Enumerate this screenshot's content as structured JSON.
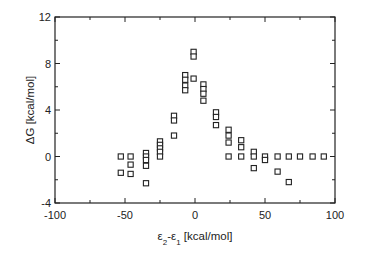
{
  "chart_data": {
    "type": "scatter",
    "title": "",
    "xlabel": "ε2-ε1 [kcal/mol]",
    "xlabel_parts": {
      "a": "ε",
      "a_sub": "2",
      "mid": "-ε",
      "b_sub": "1",
      "rest": " [kcal/mol]"
    },
    "ylabel": "ΔG [kcal/mol]",
    "xlim": [
      -100,
      100
    ],
    "ylim": [
      -4,
      12
    ],
    "xticks": [
      -100,
      -50,
      0,
      50,
      100
    ],
    "yticks": [
      -4,
      0,
      4,
      8,
      12
    ],
    "grid": false,
    "legend": null,
    "marker": "open-square",
    "series": [
      {
        "name": "data",
        "points": [
          [
            -53,
            0.0
          ],
          [
            -53,
            -1.4
          ],
          [
            -46,
            0.0
          ],
          [
            -46,
            -0.7
          ],
          [
            -46,
            -1.5
          ],
          [
            -35,
            0.3
          ],
          [
            -35,
            0.0
          ],
          [
            -35,
            -0.3
          ],
          [
            -35,
            -0.8
          ],
          [
            -35,
            -2.3
          ],
          [
            -25,
            1.3
          ],
          [
            -25,
            1.0
          ],
          [
            -25,
            0.7
          ],
          [
            -25,
            0.4
          ],
          [
            -25,
            0.0
          ],
          [
            -15,
            3.5
          ],
          [
            -15,
            3.1
          ],
          [
            -15,
            1.8
          ],
          [
            -7,
            7.0
          ],
          [
            -7,
            6.6
          ],
          [
            -7,
            6.1
          ],
          [
            -7,
            5.7
          ],
          [
            -1,
            9.0
          ],
          [
            -1,
            8.6
          ],
          [
            -1,
            6.7
          ],
          [
            6,
            6.2
          ],
          [
            6,
            5.8
          ],
          [
            6,
            5.4
          ],
          [
            6,
            4.8
          ],
          [
            15,
            3.8
          ],
          [
            15,
            3.4
          ],
          [
            15,
            2.7
          ],
          [
            24,
            2.3
          ],
          [
            24,
            1.8
          ],
          [
            24,
            1.2
          ],
          [
            24,
            0.0
          ],
          [
            33,
            1.4
          ],
          [
            33,
            0.8
          ],
          [
            33,
            0.0
          ],
          [
            42,
            0.4
          ],
          [
            42,
            0.0
          ],
          [
            42,
            -1.0
          ],
          [
            50,
            0.0
          ],
          [
            50,
            -0.3
          ],
          [
            59,
            0.0
          ],
          [
            59,
            -1.3
          ],
          [
            67,
            0.0
          ],
          [
            67,
            -2.2
          ],
          [
            75,
            0.0
          ],
          [
            84,
            0.0
          ],
          [
            92,
            0.0
          ]
        ]
      }
    ]
  },
  "colors": {
    "axis": "#222222",
    "marker_stroke": "#222222",
    "background": "#ffffff"
  }
}
